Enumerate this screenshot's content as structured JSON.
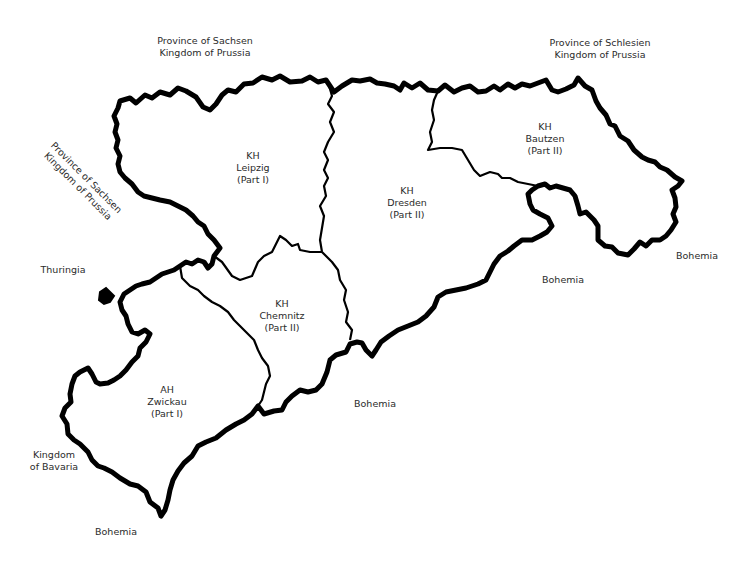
{
  "map": {
    "districts": [
      {
        "id": "leipzig",
        "lines": [
          "KH",
          "Leipzig",
          "(Part I)"
        ],
        "x": 253,
        "y": 150
      },
      {
        "id": "dresden",
        "lines": [
          "KH",
          "Dresden",
          "(Part II)"
        ],
        "x": 407,
        "y": 185
      },
      {
        "id": "bautzen",
        "lines": [
          "KH",
          "Bautzen",
          "(Part II)"
        ],
        "x": 545,
        "y": 121
      },
      {
        "id": "chemnitz",
        "lines": [
          "KH",
          "Chemnitz",
          "(Part II)"
        ],
        "x": 282,
        "y": 298
      },
      {
        "id": "zwickau",
        "lines": [
          "AH",
          "Zwickau",
          "(Part I)"
        ],
        "x": 167,
        "y": 384
      }
    ],
    "neighbors": [
      {
        "id": "sachsen-north",
        "lines": [
          "Province of Sachsen",
          "Kingdom of Prussia"
        ],
        "x": 205,
        "y": 35,
        "rotate": 0
      },
      {
        "id": "schlesien",
        "lines": [
          "Province of Schlesien",
          "Kingdom of Prussia"
        ],
        "x": 600,
        "y": 37,
        "rotate": 0
      },
      {
        "id": "sachsen-west",
        "lines": [
          "Province of Sachsen",
          "Kingdom of Prussia"
        ],
        "x": 82,
        "y": 182,
        "rotate": 45
      },
      {
        "id": "thuringia",
        "lines": [
          "Thuringia"
        ],
        "x": 63,
        "y": 264,
        "rotate": 0
      },
      {
        "id": "bavaria",
        "lines": [
          "Kingdom",
          "of Bavaria"
        ],
        "x": 54,
        "y": 452,
        "rotate": 0
      },
      {
        "id": "bohemia-sw",
        "lines": [
          "Bohemia"
        ],
        "x": 116,
        "y": 526,
        "rotate": 0
      },
      {
        "id": "bohemia-s",
        "lines": [
          "Bohemia"
        ],
        "x": 375,
        "y": 398,
        "rotate": 0
      },
      {
        "id": "bohemia-se",
        "lines": [
          "Bohemia"
        ],
        "x": 563,
        "y": 274,
        "rotate": 0
      },
      {
        "id": "bohemia-e",
        "lines": [
          "Bohemia"
        ],
        "x": 697,
        "y": 250,
        "rotate": 0
      }
    ],
    "colors": {
      "border": "#000000",
      "background": "#ffffff",
      "text": "#2b2b2b"
    }
  }
}
